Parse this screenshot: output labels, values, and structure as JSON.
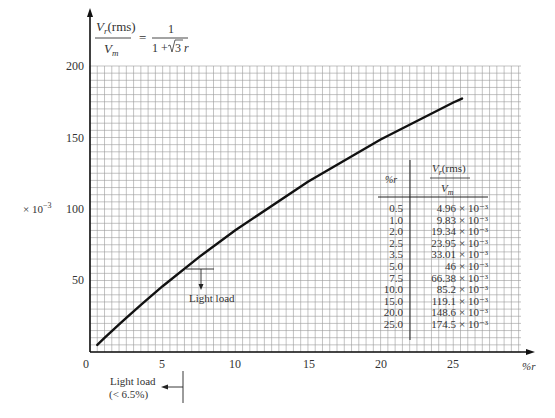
{
  "title": {
    "formula_numerator": "V",
    "formula_numerator_sub": "r",
    "formula_numerator_suffix": "(rms)",
    "formula_denominator": "V",
    "formula_denominator_sub": "m",
    "formula_equals": "=",
    "formula_rhs_numerator": "1",
    "formula_rhs_denominator_prefix": "1 +",
    "formula_rhs_sqrt": "3",
    "formula_rhs_var": "r"
  },
  "axes": {
    "y_multiplier_label": "× 10",
    "y_multiplier_exp": "−3",
    "x_unit_label": "%r",
    "y_ticks": [
      "200",
      "150",
      "100",
      "50"
    ],
    "x_ticks": [
      "0",
      "5",
      "10",
      "15",
      "20",
      "25"
    ]
  },
  "annotations": {
    "light_load_marker": "Light load",
    "light_load_region_line1": "Light load",
    "light_load_region_line2": "(< 6.5%)"
  },
  "table": {
    "header_col1": "%r",
    "header_col2_num": "V",
    "header_col2_num_sub": "r",
    "header_col2_num_suffix": "(rms)",
    "header_col2_den": "V",
    "header_col2_den_sub": "m",
    "rows": [
      {
        "r": "0.5",
        "v": "4.96",
        "exp": "× 10⁻³"
      },
      {
        "r": "1.0",
        "v": "9.83",
        "exp": "× 10⁻³"
      },
      {
        "r": "2.0",
        "v": "19.34",
        "exp": "× 10⁻³"
      },
      {
        "r": "2.5",
        "v": "23.95",
        "exp": "× 10⁻³"
      },
      {
        "r": "3.5",
        "v": "33.01",
        "exp": "× 10⁻³"
      },
      {
        "r": "5.0",
        "v": "46",
        "exp": "× 10⁻³"
      },
      {
        "r": "7.5",
        "v": "66.38",
        "exp": "× 10⁻³"
      },
      {
        "r": "10.0",
        "v": "85.2",
        "exp": "× 10⁻³"
      },
      {
        "r": "15.0",
        "v": "119.1",
        "exp": "× 10⁻³"
      },
      {
        "r": "20.0",
        "v": "148.6",
        "exp": "× 10⁻³"
      },
      {
        "r": "25.0",
        "v": "174.5",
        "exp": "× 10⁻³"
      }
    ]
  },
  "chart_data": {
    "type": "line",
    "xlabel": "%r",
    "ylabel": "Vr(rms)/Vm (× 10^-3)",
    "xlim": [
      0,
      30
    ],
    "ylim": [
      0,
      200
    ],
    "x_ticks": [
      0,
      5,
      10,
      15,
      20,
      25
    ],
    "y_ticks": [
      50,
      100,
      150,
      200
    ],
    "grid": true,
    "series": [
      {
        "name": "Vr(rms)/Vm",
        "x": [
          0.5,
          1.0,
          2.0,
          2.5,
          3.5,
          5.0,
          7.5,
          10.0,
          15.0,
          20.0,
          25.0
        ],
        "y": [
          4.96,
          9.83,
          19.34,
          23.95,
          33.01,
          46,
          66.38,
          85.2,
          119.1,
          148.6,
          174.5
        ]
      }
    ],
    "annotations": [
      {
        "text": "Light load",
        "x": 7.5,
        "y": 58
      },
      {
        "text": "Light load (< 6.5%)",
        "x": 6.5,
        "position": "below x-axis, arrow pointing left"
      }
    ],
    "legend": "inline table at right: %r vs Vr(rms)/Vm"
  }
}
